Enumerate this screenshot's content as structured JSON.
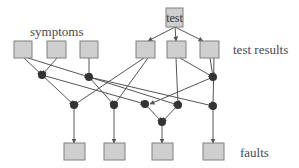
{
  "labels": {
    "symptoms": "symptoms",
    "test": "test",
    "test_results": "test results",
    "faults": "faults"
  },
  "colors": {
    "box_fill": "#cfcfcf",
    "box_stroke": "#808080",
    "edge": "#555555",
    "dot": "#333333",
    "text": "#4a4a4a"
  },
  "nodes": {
    "test": {
      "x": 166,
      "y": 8,
      "w": 17,
      "h": 19
    },
    "symptoms": [
      {
        "x": 14,
        "y": 41,
        "w": 18,
        "h": 17
      },
      {
        "x": 47,
        "y": 41,
        "w": 19,
        "h": 17
      },
      {
        "x": 80,
        "y": 41,
        "w": 18,
        "h": 17
      }
    ],
    "test_results": [
      {
        "x": 136,
        "y": 41,
        "w": 19,
        "h": 17
      },
      {
        "x": 167,
        "y": 41,
        "w": 19,
        "h": 17
      },
      {
        "x": 200,
        "y": 41,
        "w": 19,
        "h": 17
      }
    ],
    "faults": [
      {
        "x": 64,
        "y": 143,
        "w": 21,
        "h": 17
      },
      {
        "x": 104,
        "y": 143,
        "w": 21,
        "h": 17
      },
      {
        "x": 152,
        "y": 143,
        "w": 21,
        "h": 17
      },
      {
        "x": 203,
        "y": 143,
        "w": 21,
        "h": 17
      }
    ],
    "junctions": [
      {
        "id": "j1",
        "x": 42,
        "y": 75
      },
      {
        "id": "j2",
        "x": 89,
        "y": 77
      },
      {
        "id": "j3",
        "x": 213,
        "y": 77
      },
      {
        "id": "j4",
        "x": 74,
        "y": 105
      },
      {
        "id": "j5",
        "x": 114,
        "y": 105
      },
      {
        "id": "j6",
        "x": 145,
        "y": 104
      },
      {
        "id": "j7",
        "x": 178,
        "y": 105
      },
      {
        "id": "j8",
        "x": 213,
        "y": 106
      },
      {
        "id": "j9",
        "x": 162,
        "y": 122
      }
    ]
  },
  "edges": [
    {
      "from": [
        175,
        27
      ],
      "to": [
        148,
        41
      ]
    },
    {
      "from": [
        175,
        27
      ],
      "to": [
        176,
        41
      ]
    },
    {
      "from": [
        175,
        27
      ],
      "to": [
        203,
        41
      ]
    },
    {
      "from": [
        24,
        58
      ],
      "to": [
        42,
        75
      ]
    },
    {
      "from": [
        57,
        58
      ],
      "to": [
        42,
        75
      ]
    },
    {
      "from": [
        28,
        58
      ],
      "to": [
        89,
        77
      ]
    },
    {
      "from": [
        89,
        58
      ],
      "to": [
        89,
        77
      ]
    },
    {
      "from": [
        180,
        58
      ],
      "to": [
        213,
        77
      ]
    },
    {
      "from": [
        210,
        58
      ],
      "to": [
        213,
        77
      ]
    },
    {
      "from": [
        42,
        75
      ],
      "to": [
        74,
        105
      ]
    },
    {
      "from": [
        42,
        75
      ],
      "to": [
        145,
        104
      ]
    },
    {
      "from": [
        89,
        77
      ],
      "to": [
        114,
        105
      ]
    },
    {
      "from": [
        89,
        77
      ],
      "to": [
        178,
        105
      ]
    },
    {
      "from": [
        89,
        77
      ],
      "to": [
        213,
        106
      ]
    },
    {
      "from": [
        144,
        58
      ],
      "to": [
        74,
        105
      ]
    },
    {
      "from": [
        148,
        58
      ],
      "to": [
        114,
        105
      ]
    },
    {
      "from": [
        176,
        58
      ],
      "to": [
        178,
        105
      ]
    },
    {
      "from": [
        214,
        58
      ],
      "to": [
        213,
        106
      ]
    },
    {
      "from": [
        213,
        77
      ],
      "to": [
        150,
        104
      ]
    },
    {
      "from": [
        145,
        104
      ],
      "to": [
        162,
        122
      ]
    },
    {
      "from": [
        178,
        105
      ],
      "to": [
        162,
        122
      ]
    },
    {
      "from": [
        74,
        105
      ],
      "to": [
        74,
        143
      ]
    },
    {
      "from": [
        114,
        105
      ],
      "to": [
        114,
        143
      ]
    },
    {
      "from": [
        162,
        122
      ],
      "to": [
        162,
        143
      ]
    },
    {
      "from": [
        213,
        106
      ],
      "to": [
        213,
        143
      ]
    }
  ]
}
